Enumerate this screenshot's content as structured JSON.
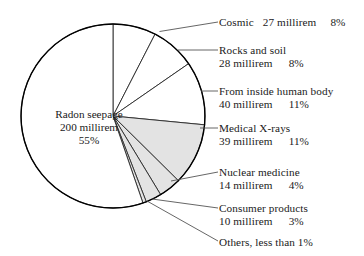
{
  "chart_data": {
    "type": "pie",
    "title": "",
    "subtitle": "",
    "xlabel": "",
    "ylabel": "",
    "legend_position": "right-callout",
    "unit": "millirem",
    "total_millirem": 358,
    "categories": [
      "Radon seepage",
      "Cosmic",
      "Rocks and soil",
      "From inside human body",
      "Medical X-rays",
      "Nuclear medicine",
      "Consumer products",
      "Others"
    ],
    "values": [
      200,
      27,
      28,
      40,
      39,
      14,
      10,
      1
    ],
    "percents": [
      55,
      8,
      8,
      11,
      11,
      4,
      3,
      0.5
    ],
    "slices": [
      {
        "name": "Cosmic",
        "label": "Cosmic",
        "amount": "27 millirem",
        "percent": "8%",
        "value": 27,
        "pct": 8,
        "fill": "#ffffff",
        "start_deg": 0,
        "end_deg": 27.2
      },
      {
        "name": "Rocks and soil",
        "label": "Rocks and soil",
        "amount": "28 millirem",
        "percent": "8%",
        "value": 28,
        "pct": 8,
        "fill": "#ffffff",
        "start_deg": 27.2,
        "end_deg": 55.3
      },
      {
        "name": "From inside human body",
        "label": "From inside human body",
        "amount": "40 millirem",
        "percent": "11%",
        "value": 40,
        "pct": 11,
        "fill": "#ffffff",
        "start_deg": 55.3,
        "end_deg": 95.5
      },
      {
        "name": "Medical X-rays",
        "label": "Medical X-rays",
        "amount": "39 millirem",
        "percent": "11%",
        "value": 39,
        "pct": 11,
        "fill": "#e3e3e3",
        "start_deg": 95.5,
        "end_deg": 134.7
      },
      {
        "name": "Nuclear medicine",
        "label": "Nuclear medicine",
        "amount": "14 millirem",
        "percent": "4%",
        "value": 14,
        "pct": 4,
        "fill": "#e3e3e3",
        "start_deg": 134.7,
        "end_deg": 148.8
      },
      {
        "name": "Consumer products",
        "label": "Consumer products",
        "amount": "10 millirem",
        "percent": "3%",
        "value": 10,
        "pct": 3,
        "fill": "#e3e3e3",
        "start_deg": 148.8,
        "end_deg": 158.8
      },
      {
        "name": "Others",
        "label": "Others, less than 1%",
        "amount": "",
        "percent": "less than 1%",
        "value": 1,
        "pct": 0.5,
        "fill": "#e3e3e3",
        "start_deg": 158.8,
        "end_deg": 161.0
      },
      {
        "name": "Radon seepage",
        "label": "Radon seepage",
        "amount": "200 millirem",
        "percent": "55%",
        "value": 200,
        "pct": 55,
        "fill": "#ffffff",
        "start_deg": 161.0,
        "end_deg": 360
      }
    ],
    "colors": {
      "outline": "#000000",
      "slice_white": "#ffffff",
      "slice_gray": "#e3e3e3",
      "leader": "#444444",
      "text": "#1a1a1a"
    },
    "center_label": {
      "line1": "Radon seepage",
      "line2": "200 millirem",
      "line3": "55%"
    },
    "callouts": [
      {
        "name": "cosmic",
        "line1": "Cosmic",
        "line2_num": "27 millirem",
        "line2_pct": "8%",
        "single_line": true
      },
      {
        "name": "rocks-soil",
        "line1": "Rocks and soil",
        "line2_num": "28 millirem",
        "line2_pct": "8%",
        "single_line": false
      },
      {
        "name": "human-body",
        "line1": "From inside human body",
        "line2_num": "40 millirem",
        "line2_pct": "11%",
        "single_line": false
      },
      {
        "name": "medical-xrays",
        "line1": "Medical X-rays",
        "line2_num": "39 millirem",
        "line2_pct": "11%",
        "single_line": false
      },
      {
        "name": "nuclear-med",
        "line1": "Nuclear medicine",
        "line2_num": "14 millirem",
        "line2_pct": "4%",
        "single_line": false
      },
      {
        "name": "consumer",
        "line1": "Consumer products",
        "line2_num": "10 millirem",
        "line2_pct": "3%",
        "single_line": false
      },
      {
        "name": "others",
        "line1": "Others, less than 1%",
        "line2_num": "",
        "line2_pct": "",
        "single_line": true
      }
    ]
  }
}
